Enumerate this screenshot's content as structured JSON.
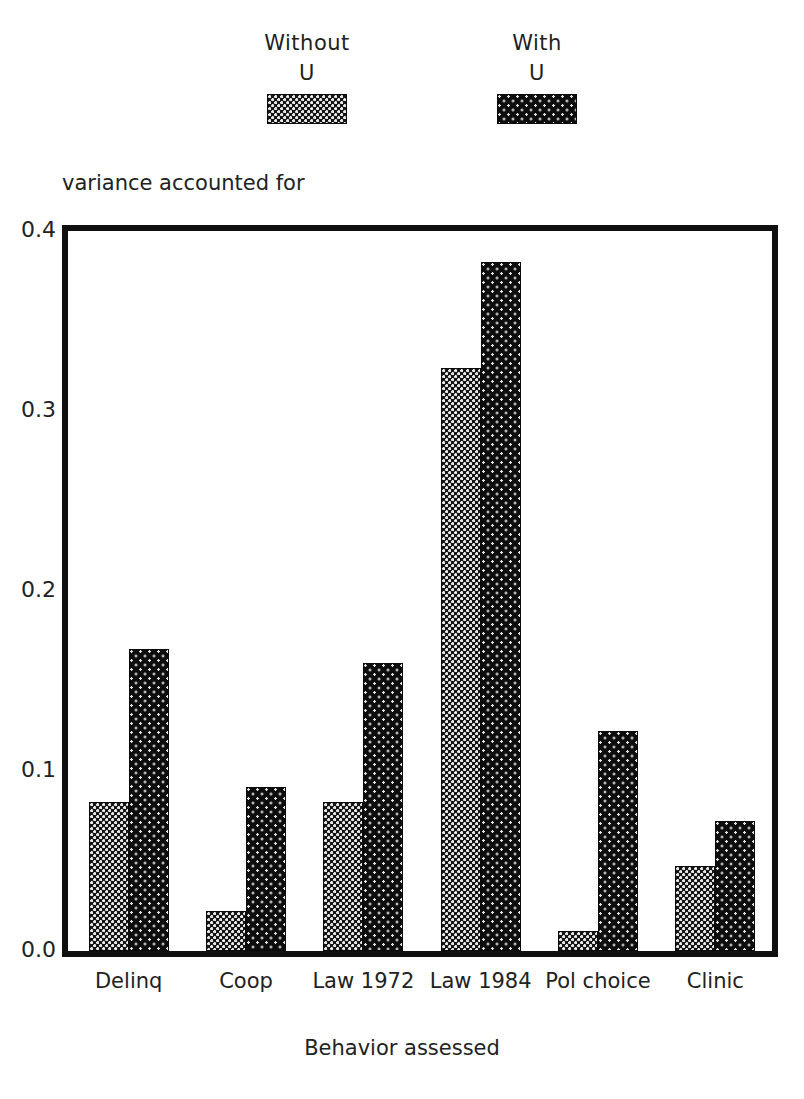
{
  "legend": {
    "entries": [
      {
        "line1": "Without",
        "line2": "U",
        "swatch": "without-u-swatch"
      },
      {
        "line1": "With",
        "line2": "U",
        "swatch": "with-u-swatch"
      }
    ]
  },
  "axis": {
    "y_title": "variance accounted for",
    "x_title": "Behavior assessed"
  },
  "chart_data": {
    "type": "bar",
    "title": "",
    "xlabel": "Behavior assessed",
    "ylabel": "variance accounted for",
    "ylim": [
      0.0,
      0.4
    ],
    "yticks": [
      "0.0",
      "0.1",
      "0.2",
      "0.3",
      "0.4"
    ],
    "ytick_values": [
      0.0,
      0.1,
      0.2,
      0.3,
      0.4
    ],
    "grid": false,
    "legend_position": "top",
    "categories": [
      "Delinq",
      "Coop",
      "Law 1972",
      "Law 1984",
      "Pol choice",
      "Clinic"
    ],
    "series": [
      {
        "name": "Without U",
        "values": [
          0.083,
          0.022,
          0.083,
          0.324,
          0.011,
          0.047
        ]
      },
      {
        "name": "With U",
        "values": [
          0.168,
          0.091,
          0.16,
          0.383,
          0.122,
          0.072
        ]
      }
    ]
  },
  "colors": {
    "ink": "#101010",
    "without_u_fill": "#151515",
    "with_u_fill": "#0d0d0d",
    "background": "#ffffff"
  }
}
